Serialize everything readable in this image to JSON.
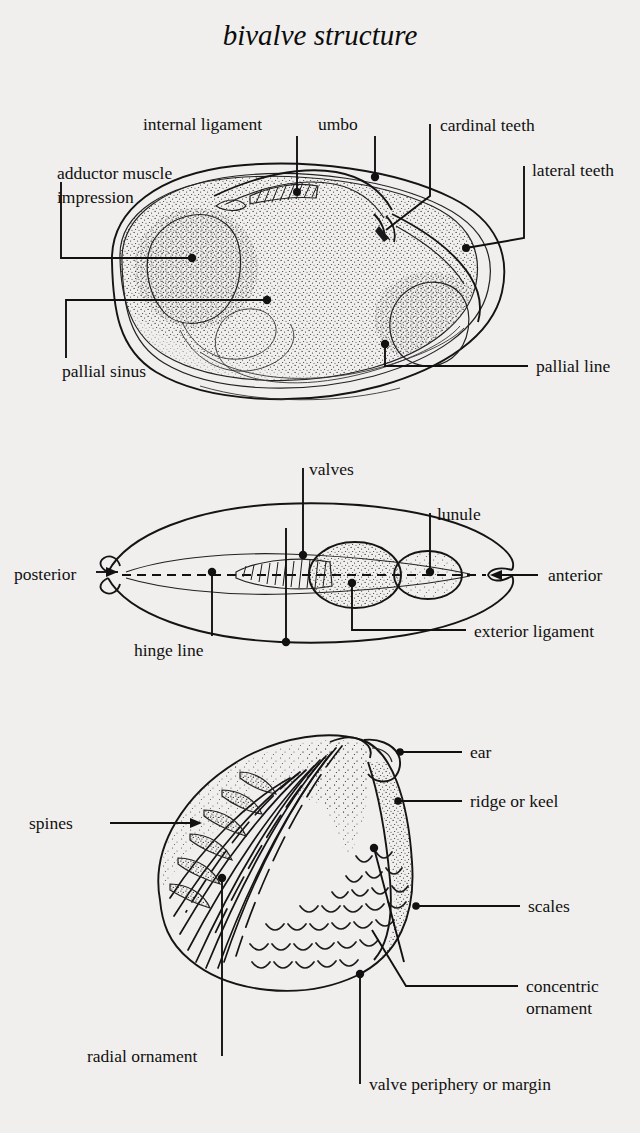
{
  "page": {
    "title": "bivalve structure",
    "background_color": "#f0efed",
    "ink_color": "#111111",
    "width": 640,
    "height": 1133
  },
  "figures": [
    {
      "id": "interior-valve-view",
      "name": "interior of left valve",
      "labels": [
        {
          "key": "internal_ligament",
          "text": "internal ligament"
        },
        {
          "key": "umbo",
          "text": "umbo"
        },
        {
          "key": "cardinal_teeth",
          "text": "cardinal teeth"
        },
        {
          "key": "lateral_teeth",
          "text": "lateral teeth"
        },
        {
          "key": "adductor_muscle_impression_line1",
          "text": "adductor muscle"
        },
        {
          "key": "adductor_muscle_impression_line2",
          "text": "impression"
        },
        {
          "key": "pallial_sinus",
          "text": "pallial sinus"
        },
        {
          "key": "pallial_line",
          "text": "pallial line"
        }
      ]
    },
    {
      "id": "dorsal-view",
      "name": "dorsal view of closed valves",
      "labels": [
        {
          "key": "valves",
          "text": "valves"
        },
        {
          "key": "lunule",
          "text": "lunule"
        },
        {
          "key": "posterior",
          "text": "posterior"
        },
        {
          "key": "anterior",
          "text": "anterior"
        },
        {
          "key": "hinge_line",
          "text": "hinge line"
        },
        {
          "key": "exterior_ligament",
          "text": "exterior ligament"
        }
      ]
    },
    {
      "id": "exterior-valve-view",
      "name": "exterior of valve with ornament",
      "labels": [
        {
          "key": "ear",
          "text": "ear"
        },
        {
          "key": "ridge_or_keel",
          "text": "ridge or keel"
        },
        {
          "key": "spines",
          "text": "spines"
        },
        {
          "key": "scales",
          "text": "scales"
        },
        {
          "key": "concentric_ornament_line1",
          "text": "concentric"
        },
        {
          "key": "concentric_ornament_line2",
          "text": "ornament"
        },
        {
          "key": "radial_ornament",
          "text": "radial ornament"
        },
        {
          "key": "valve_periphery",
          "text": "valve periphery or margin"
        }
      ]
    }
  ]
}
